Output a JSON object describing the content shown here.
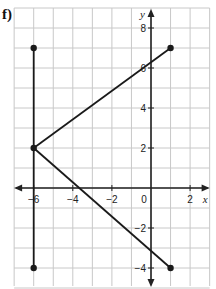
{
  "label": "f)",
  "chart_data": {
    "type": "line",
    "title": "",
    "xlabel": "x",
    "ylabel": "y",
    "xlim": [
      -7,
      3
    ],
    "ylim": [
      -5,
      9
    ],
    "grid": true,
    "x_ticks": [
      -6,
      -4,
      -2,
      0,
      2
    ],
    "y_ticks": [
      8,
      6,
      4,
      2,
      -2,
      -4
    ],
    "x_tick_labels": [
      "-6",
      "-4",
      "-2",
      "0",
      "2"
    ],
    "y_tick_labels": [
      "8",
      "6",
      "4",
      "2",
      "-2",
      "-4"
    ],
    "series": [
      {
        "name": "vertical segment",
        "points": [
          [
            -6,
            7
          ],
          [
            -6,
            -4
          ]
        ]
      },
      {
        "name": "upper segment",
        "points": [
          [
            -6,
            2
          ],
          [
            1,
            7
          ]
        ]
      },
      {
        "name": "lower segment",
        "points": [
          [
            -6,
            2
          ],
          [
            1,
            -4
          ]
        ]
      }
    ],
    "endpoints": [
      [
        -6,
        7
      ],
      [
        -6,
        -4
      ],
      [
        -6,
        2
      ],
      [
        1,
        7
      ],
      [
        1,
        -4
      ]
    ]
  },
  "style": {
    "grid_color": "#c8c8c8",
    "axis_color": "#222222",
    "line_color": "#1a1a1a"
  }
}
